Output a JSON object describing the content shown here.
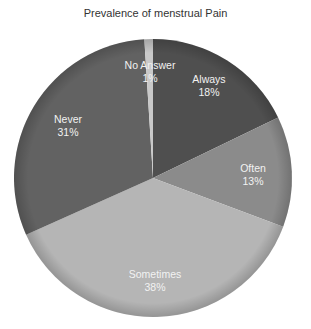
{
  "chart_data": {
    "type": "pie",
    "title": "Prevalence of menstrual Pain",
    "start_angle_deg": 0,
    "direction": "clockwise",
    "slices": [
      {
        "label": "Always",
        "value": 18,
        "percent_label": "18%",
        "color": "#4f4f4f"
      },
      {
        "label": "Often",
        "value": 13,
        "percent_label": "13%",
        "color": "#8b8b8b"
      },
      {
        "label": "Sometimes",
        "value": 38,
        "percent_label": "38%",
        "color": "#b5b5b5"
      },
      {
        "label": "Never",
        "value": 31,
        "percent_label": "31%",
        "color": "#626262"
      },
      {
        "label": "No Answer",
        "value": 1,
        "percent_label": "1%",
        "color": "#c9c9c9"
      }
    ],
    "legend": "none",
    "labels_inside": true
  },
  "labels": {
    "always": {
      "name": "Always",
      "pct": "18%"
    },
    "often": {
      "name": "Often",
      "pct": "13%"
    },
    "sometimes": {
      "name": "Sometimes",
      "pct": "38%"
    },
    "never": {
      "name": "Never",
      "pct": "31%"
    },
    "no_answer": {
      "name": "No Answer",
      "pct": "1%"
    }
  }
}
